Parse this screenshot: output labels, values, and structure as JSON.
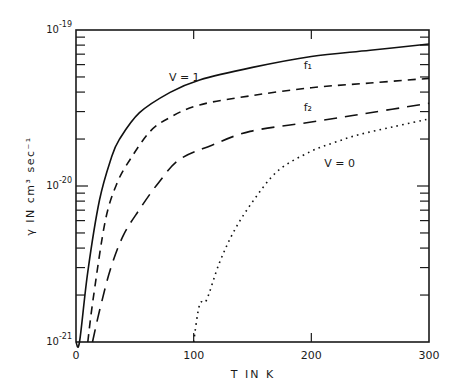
{
  "chart_data": {
    "type": "line",
    "title": "",
    "xlabel": "T IN K",
    "ylabel": "γ IN cm³ sec⁻¹",
    "xscale": "linear",
    "yscale": "log",
    "xlim": [
      0,
      300
    ],
    "ylim": [
      1e-21,
      1e-19
    ],
    "x_ticks": [
      0,
      100,
      200,
      300
    ],
    "x_tick_labels": [
      "0",
      "100",
      "200",
      "300"
    ],
    "y_ticks": [
      1e-21,
      1e-20,
      1e-19
    ],
    "y_tick_labels": [
      {
        "base": "10",
        "exp": "-21"
      },
      {
        "base": "10",
        "exp": "-20"
      },
      {
        "base": "10",
        "exp": "-19"
      }
    ],
    "grid": false,
    "legend": "none (curves labeled inline)",
    "series": [
      {
        "name": "V = 1",
        "style": "solid",
        "label_pos": {
          "T": 92,
          "logy": -19.33
        },
        "points": [
          [
            0,
            -21.0
          ],
          [
            3,
            -21.0
          ],
          [
            10,
            -20.55
          ],
          [
            20,
            -20.09
          ],
          [
            30,
            -19.82
          ],
          [
            37,
            -19.7
          ],
          [
            54,
            -19.53
          ],
          [
            80,
            -19.4
          ],
          [
            105,
            -19.32
          ],
          [
            150,
            -19.24
          ],
          [
            200,
            -19.17
          ],
          [
            250,
            -19.13
          ],
          [
            300,
            -19.09
          ]
        ]
      },
      {
        "name": "f₁",
        "style": "dashed",
        "label_pos": {
          "T": 197,
          "logy": -19.25
        },
        "points": [
          [
            10,
            -21.0
          ],
          [
            15,
            -20.7
          ],
          [
            25,
            -20.22
          ],
          [
            35,
            -19.98
          ],
          [
            46,
            -19.83
          ],
          [
            63,
            -19.65
          ],
          [
            80,
            -19.56
          ],
          [
            105,
            -19.48
          ],
          [
            150,
            -19.42
          ],
          [
            200,
            -19.37
          ],
          [
            250,
            -19.34
          ],
          [
            300,
            -19.31
          ]
        ]
      },
      {
        "name": "f₂",
        "style": "long-dashed",
        "label_pos": {
          "T": 197,
          "logy": -19.52
        },
        "points": [
          [
            14,
            -21.0
          ],
          [
            20,
            -20.8
          ],
          [
            29,
            -20.54
          ],
          [
            40,
            -20.32
          ],
          [
            54,
            -20.15
          ],
          [
            70,
            -19.98
          ],
          [
            88,
            -19.83
          ],
          [
            115,
            -19.74
          ],
          [
            148,
            -19.65
          ],
          [
            200,
            -19.59
          ],
          [
            250,
            -19.53
          ],
          [
            300,
            -19.47
          ]
        ]
      },
      {
        "name": "V = 0",
        "style": "dotted",
        "label_pos": {
          "T": 224,
          "logy": -19.88
        },
        "points": [
          [
            100,
            -21.0
          ],
          [
            105,
            -20.76
          ],
          [
            111,
            -20.73
          ],
          [
            122,
            -20.49
          ],
          [
            135,
            -20.28
          ],
          [
            152,
            -20.08
          ],
          [
            172,
            -19.9
          ],
          [
            199,
            -19.78
          ],
          [
            220,
            -19.72
          ],
          [
            241,
            -19.67
          ],
          [
            270,
            -19.62
          ],
          [
            300,
            -19.57
          ]
        ]
      }
    ]
  }
}
